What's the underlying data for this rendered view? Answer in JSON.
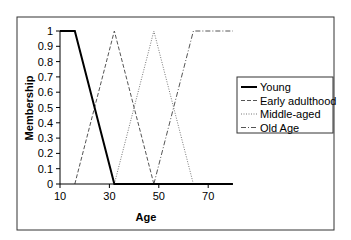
{
  "chart_data": {
    "type": "line",
    "title": "",
    "xlabel": "Age",
    "ylabel": "Membership",
    "xlim": [
      10,
      80
    ],
    "ylim": [
      0,
      1
    ],
    "x_ticks": [
      10,
      30,
      50,
      70
    ],
    "y_ticks": [
      0,
      0.1,
      0.2,
      0.3,
      0.4,
      0.5,
      0.6,
      0.7,
      0.8,
      0.9,
      1
    ],
    "y_tick_labels": [
      "0",
      "0.1",
      "0.2",
      "0.3",
      "0.4",
      "0.5",
      "0.6",
      "0.7",
      "0.8",
      "0.9",
      "1"
    ],
    "x_tick_labels": [
      "10",
      "30",
      "50",
      "70"
    ],
    "grid": false,
    "legend_position": "right",
    "series": [
      {
        "name": "Young",
        "style": "solid",
        "color": "#000000",
        "width": 2,
        "points": [
          [
            10,
            1
          ],
          [
            16,
            1
          ],
          [
            32,
            0
          ],
          [
            80,
            0
          ]
        ]
      },
      {
        "name": "Early adulthood",
        "style": "dashed",
        "color": "#555555",
        "width": 1,
        "points": [
          [
            16,
            0
          ],
          [
            32,
            1
          ],
          [
            48,
            0
          ]
        ]
      },
      {
        "name": "Middle-aged",
        "style": "dotted",
        "color": "#777777",
        "width": 1,
        "points": [
          [
            32,
            0
          ],
          [
            48,
            1
          ],
          [
            64,
            0
          ]
        ]
      },
      {
        "name": "Old Age",
        "style": "dashdot",
        "color": "#555555",
        "width": 1,
        "points": [
          [
            48,
            0
          ],
          [
            64,
            1
          ],
          [
            80,
            1
          ]
        ]
      }
    ]
  }
}
